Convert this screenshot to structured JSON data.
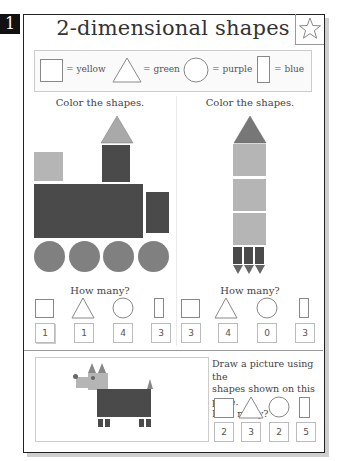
{
  "page": {
    "number": "1",
    "title": "2-dimensional shapes",
    "star_icon": "star-outline-icon"
  },
  "legend": {
    "items": [
      {
        "shape": "square",
        "label": "= yellow",
        "color": "#f5d800"
      },
      {
        "shape": "triangle",
        "label": "= green",
        "color": "#3a9a3a"
      },
      {
        "shape": "circle",
        "label": "= purple",
        "color": "#7a3a9a"
      },
      {
        "shape": "rectangle",
        "label": "= blue",
        "color": "#2a5ab0"
      }
    ]
  },
  "left_panel": {
    "instruction": "Color the shapes.",
    "picture": "train",
    "how_many_label": "How many?",
    "counts": [
      {
        "shape": "square",
        "value": "1"
      },
      {
        "shape": "triangle",
        "value": "1"
      },
      {
        "shape": "circle",
        "value": "4"
      },
      {
        "shape": "rectangle",
        "value": "3"
      }
    ]
  },
  "right_panel": {
    "instruction": "Color the shapes.",
    "picture": "rocket",
    "how_many_label": "How many?",
    "counts": [
      {
        "shape": "square",
        "value": "3"
      },
      {
        "shape": "triangle",
        "value": "4"
      },
      {
        "shape": "circle",
        "value": "0"
      },
      {
        "shape": "rectangle",
        "value": "3"
      }
    ]
  },
  "bottom_panel": {
    "picture": "dog",
    "instruction_line1": "Draw a picture using the",
    "instruction_line2": "shapes shown on this page.",
    "instruction_line3": "How many?",
    "counts": [
      {
        "shape": "square",
        "value": "2"
      },
      {
        "shape": "triangle",
        "value": "3"
      },
      {
        "shape": "circle",
        "value": "2"
      },
      {
        "shape": "rectangle",
        "value": "5"
      }
    ]
  }
}
